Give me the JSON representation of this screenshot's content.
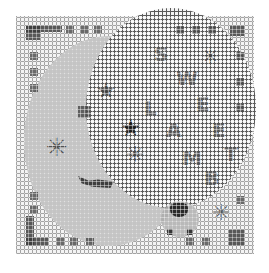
{
  "image": {
    "subject": "needlepoint canvas",
    "text_words": [
      "SWEET",
      "LAMB"
    ],
    "letters_sweet": [
      "S",
      "W",
      "E",
      "E",
      "T"
    ],
    "letters_lamb": [
      "L",
      "A",
      "M",
      "B"
    ],
    "colors": {
      "background": "#ffffff",
      "canvas": "#f4f4f4",
      "grid": "#5a5a5a",
      "stitch_dark": "#3c3c3c",
      "stitch_light": "#b4b4b4"
    }
  }
}
